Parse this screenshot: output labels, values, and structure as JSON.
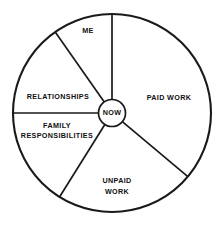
{
  "diagram": {
    "type": "radial-wheel",
    "background_color": "#ffffff",
    "line_color": "#1a1a1a",
    "text_color": "#111111",
    "geometry": {
      "center_x": 112,
      "center_y": 113,
      "outer_radius": 99,
      "hub_radius": 13.5
    },
    "hub": {
      "label": "NOW",
      "x": 112,
      "y": 113.5
    },
    "sectors": [
      {
        "label": "ME",
        "lines": [
          "ME"
        ],
        "start_angle": 90,
        "end_angle": 125,
        "label_x": 88,
        "label_y": 31,
        "line_positions": [
          {
            "x": 88,
            "y": 31
          }
        ]
      },
      {
        "label": "RELATIONSHIPS",
        "lines": [
          "RELATIONSHIPS"
        ],
        "start_angle": 125,
        "end_angle": 180,
        "label_x": 58,
        "label_y": 97,
        "line_positions": [
          {
            "x": 58,
            "y": 97
          }
        ]
      },
      {
        "label": "FAMILY RESPONSIBILITIES",
        "lines": [
          "FAMILY",
          "RESPONSIBILITIES"
        ],
        "start_angle": 180,
        "end_angle": 238,
        "label_x": 57,
        "label_y": 132,
        "line_positions": [
          {
            "x": 57,
            "y": 126
          },
          {
            "x": 57,
            "y": 136.5
          }
        ]
      },
      {
        "label": "UNPAID WORK",
        "lines": [
          "UNPAID",
          "WORK"
        ],
        "start_angle": 238,
        "end_angle": 320,
        "label_x": 117,
        "label_y": 186,
        "line_positions": [
          {
            "x": 117,
            "y": 181
          },
          {
            "x": 117,
            "y": 192
          }
        ]
      },
      {
        "label": "PAID WORK",
        "lines": [
          "PAID WORK"
        ],
        "start_angle": 320,
        "end_angle": 450,
        "label_x": 169,
        "label_y": 98,
        "line_positions": [
          {
            "x": 169,
            "y": 98
          }
        ]
      }
    ],
    "spokes": [
      {
        "name": "spoke-me-paidwork",
        "angle": 90
      },
      {
        "name": "spoke-me-relationships",
        "angle": 125
      },
      {
        "name": "spoke-relationships-family",
        "angle": 180
      },
      {
        "name": "spoke-family-unpaidwork",
        "angle": 238
      },
      {
        "name": "spoke-unpaidwork-paidwork",
        "angle": 320
      }
    ]
  }
}
